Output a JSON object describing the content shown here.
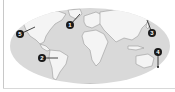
{
  "map": {
    "projection": "elliptical world map",
    "colors": {
      "ocean": "#d9d9d9",
      "land": "#f4f4f4",
      "coast": "#9a9a9a",
      "marker": "#1a1a1a",
      "marker_text": "#ffffff"
    },
    "markers": [
      {
        "id": 1,
        "label": "1",
        "x": 70,
        "y": 25,
        "leader_to": [
          80,
          14
        ]
      },
      {
        "id": 2,
        "label": "2",
        "x": 42,
        "y": 58,
        "leader_to": [
          58,
          58
        ]
      },
      {
        "id": 3,
        "label": "3",
        "x": 152,
        "y": 33,
        "leader_to": [
          147,
          20
        ]
      },
      {
        "id": 4,
        "label": "4",
        "x": 158,
        "y": 52,
        "leader_to": [
          158,
          67
        ]
      },
      {
        "id": 5,
        "label": "5",
        "x": 20,
        "y": 34,
        "leader_to": [
          35,
          27
        ]
      }
    ]
  }
}
